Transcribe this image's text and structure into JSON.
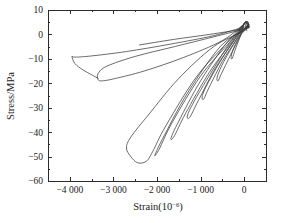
{
  "chart_data": {
    "type": "line",
    "title": "",
    "xlabel": "Strain(10⁻⁶)",
    "ylabel": "Stress/MPa",
    "xlim": [
      -4500,
      500
    ],
    "ylim": [
      -60,
      10
    ],
    "xticks": [
      -4000,
      -3000,
      -2000,
      -1000,
      0
    ],
    "xticklabels": [
      "−4 000",
      "−3 000",
      "−2 000",
      "−1 000",
      "0"
    ],
    "yticks": [
      10,
      0,
      -10,
      -20,
      -30,
      -40,
      -50,
      -60
    ],
    "yticklabels": [
      "10",
      "0",
      "−10",
      "−20",
      "−30",
      "−40",
      "−50",
      "−60"
    ],
    "minor_ticks": true,
    "grid": false,
    "legend": null,
    "frame": "box",
    "tick_direction": "in",
    "line_color": "#3a3a3a",
    "background": "#ffffff",
    "series": [
      {
        "name": "loop-1",
        "comment": "smallest loop near origin",
        "points": [
          [
            60,
            1.5
          ],
          [
            10,
            4.5
          ],
          [
            -60,
            0.5
          ],
          [
            -150,
            -3.5
          ],
          [
            -230,
            -7.5
          ],
          [
            -280,
            -10.0
          ],
          [
            -300,
            -9.0
          ],
          [
            -250,
            -6.0
          ],
          [
            -160,
            -2.5
          ],
          [
            -70,
            0.0
          ],
          [
            30,
            2.0
          ],
          [
            90,
            3.5
          ]
        ]
      },
      {
        "name": "loop-2",
        "points": [
          [
            80,
            2.5
          ],
          [
            20,
            5.0
          ],
          [
            -120,
            -1.5
          ],
          [
            -330,
            -9.0
          ],
          [
            -520,
            -16.0
          ],
          [
            -600,
            -19.0
          ],
          [
            -620,
            -17.5
          ],
          [
            -520,
            -13.0
          ],
          [
            -340,
            -7.0
          ],
          [
            -150,
            -1.5
          ],
          [
            20,
            2.5
          ],
          [
            90,
            4.0
          ]
        ]
      },
      {
        "name": "loop-3",
        "points": [
          [
            90,
            3.0
          ],
          [
            20,
            5.0
          ],
          [
            -180,
            -2.0
          ],
          [
            -500,
            -11.0
          ],
          [
            -800,
            -21.5
          ],
          [
            -930,
            -26.5
          ],
          [
            -960,
            -25.0
          ],
          [
            -820,
            -19.5
          ],
          [
            -530,
            -10.5
          ],
          [
            -220,
            -2.0
          ],
          [
            10,
            2.5
          ],
          [
            95,
            4.0
          ]
        ]
      },
      {
        "name": "loop-4",
        "points": [
          [
            95,
            3.0
          ],
          [
            25,
            5.0
          ],
          [
            -230,
            -2.5
          ],
          [
            -650,
            -13.5
          ],
          [
            -1050,
            -27.0
          ],
          [
            -1250,
            -34.0
          ],
          [
            -1300,
            -33.0
          ],
          [
            -1120,
            -26.5
          ],
          [
            -720,
            -14.5
          ],
          [
            -290,
            -2.5
          ],
          [
            20,
            2.5
          ],
          [
            100,
            4.0
          ]
        ]
      },
      {
        "name": "loop-5",
        "points": [
          [
            100,
            3.0
          ],
          [
            30,
            5.0
          ],
          [
            -280,
            -3.0
          ],
          [
            -800,
            -15.5
          ],
          [
            -1350,
            -32.5
          ],
          [
            -1600,
            -41.5
          ],
          [
            -1680,
            -42.5
          ],
          [
            -1500,
            -35.5
          ],
          [
            -1000,
            -19.0
          ],
          [
            -400,
            -3.5
          ],
          [
            20,
            2.5
          ],
          [
            105,
            4.0
          ]
        ]
      },
      {
        "name": "loop-6",
        "points": [
          [
            105,
            3.0
          ],
          [
            35,
            5.0
          ],
          [
            -350,
            -3.5
          ],
          [
            -1000,
            -17.0
          ],
          [
            -1650,
            -36.0
          ],
          [
            -1950,
            -47.0
          ],
          [
            -2050,
            -49.5
          ],
          [
            -1880,
            -43.0
          ],
          [
            -1300,
            -24.0
          ],
          [
            -550,
            -5.0
          ],
          [
            10,
            2.0
          ],
          [
            105,
            4.0
          ]
        ]
      },
      {
        "name": "loop-7",
        "comment": "deepest loop, bottom tip near -52 MPa",
        "points": [
          [
            105,
            3.0
          ],
          [
            35,
            5.0
          ],
          [
            -400,
            -3.5
          ],
          [
            -1100,
            -17.5
          ],
          [
            -1800,
            -37.5
          ],
          [
            -2100,
            -48.0
          ],
          [
            -2250,
            -52.0
          ],
          [
            -2450,
            -52.5
          ],
          [
            -2600,
            -50.0
          ],
          [
            -2700,
            -46.5
          ],
          [
            -2600,
            -42.0
          ],
          [
            -2200,
            -33.0
          ],
          [
            -1500,
            -18.0
          ],
          [
            -700,
            -5.0
          ],
          [
            0,
            1.5
          ],
          [
            100,
            3.5
          ]
        ]
      },
      {
        "name": "loop-8",
        "comment": "wide loop reaching -3350 strain, -19 MPa",
        "points": [
          [
            100,
            3.0
          ],
          [
            30,
            4.5
          ],
          [
            -500,
            -2.5
          ],
          [
            -1400,
            -9.5
          ],
          [
            -2300,
            -15.0
          ],
          [
            -2950,
            -18.0
          ],
          [
            -3250,
            -19.0
          ],
          [
            -3350,
            -18.5
          ],
          [
            -3350,
            -16.0
          ],
          [
            -3150,
            -13.0
          ],
          [
            -2500,
            -9.0
          ],
          [
            -1600,
            -5.0
          ],
          [
            -700,
            -1.0
          ],
          [
            50,
            2.5
          ],
          [
            100,
            3.5
          ]
        ]
      },
      {
        "name": "loop-9",
        "comment": "outermost loop reaching -3950 strain, -9 MPa",
        "points": [
          [
            95,
            2.5
          ],
          [
            0,
            3.0
          ],
          [
            -700,
            -0.5
          ],
          [
            -1700,
            -4.0
          ],
          [
            -2700,
            -7.0
          ],
          [
            -3500,
            -8.8
          ],
          [
            -3880,
            -9.3
          ],
          [
            -3950,
            -9.0
          ],
          [
            -3880,
            -12.0
          ],
          [
            -3700,
            -14.5
          ],
          [
            -3500,
            -16.5
          ],
          [
            -3350,
            -18.0
          ]
        ]
      },
      {
        "name": "free-upper-segment",
        "comment": "upper branch ending unattached near -2400 strain",
        "points": [
          [
            -2400,
            -4.3
          ],
          [
            -1600,
            -2.0
          ],
          [
            -800,
            0.0
          ],
          [
            -100,
            2.0
          ],
          [
            95,
            3.0
          ]
        ]
      }
    ]
  },
  "axes": {
    "ylabel_text": "Stress/MPa",
    "xlabel_base": "Strain(10",
    "xlabel_sup": "−6",
    "xlabel_close": ")"
  }
}
